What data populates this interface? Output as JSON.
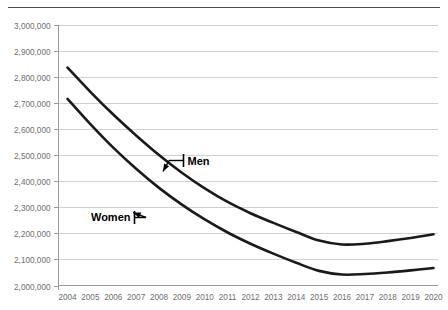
{
  "chart_data": {
    "type": "line",
    "title": "",
    "subtitle": "",
    "xlabel": "",
    "ylabel": "",
    "categories": [
      "2004",
      "2005",
      "2006",
      "2007",
      "2008",
      "2009",
      "2010",
      "2011",
      "2012",
      "2013",
      "2014",
      "2015",
      "2016",
      "2017",
      "2018",
      "2019",
      "2020"
    ],
    "series": [
      {
        "name": "Men",
        "values": [
          2835000,
          2742000,
          2655000,
          2575000,
          2500000,
          2432000,
          2372000,
          2320000,
          2277000,
          2240000,
          2205000,
          2172000,
          2157000,
          2160000,
          2170000,
          2182000,
          2196000
        ]
      },
      {
        "name": "Women",
        "values": [
          2715000,
          2618000,
          2528000,
          2447000,
          2374000,
          2310000,
          2253000,
          2203000,
          2160000,
          2122000,
          2087000,
          2056000,
          2042000,
          2044000,
          2050000,
          2058000,
          2067000
        ]
      }
    ],
    "ylim": [
      2000000,
      3000000
    ],
    "ytick_step": 100000,
    "ytick_labels": [
      "3,000,000",
      "2,900,000",
      "2,800,000",
      "2,700,000",
      "2,600,000",
      "2,500,000",
      "2,400,000",
      "2,300,000",
      "2,200,000",
      "2,100,000",
      "2,000,000"
    ],
    "ytick_values": [
      3000000,
      2900000,
      2800000,
      2700000,
      2600000,
      2500000,
      2400000,
      2300000,
      2200000,
      2100000,
      2000000
    ],
    "grid": true,
    "grid_orientation": "horizontal",
    "legend": "none",
    "annotations": [
      {
        "name": "Men",
        "label": "Men",
        "target_category": "2008",
        "target_value": 2410000
      },
      {
        "name": "Women",
        "label": "Women",
        "target_category": "2007",
        "target_value": 2310000
      }
    ],
    "colors": {
      "men_line": "#1a1a1a",
      "women_line": "#1a1a1a",
      "gridline": "#d0d0d0",
      "axis": "#9a9a9a",
      "tick_label": "#6e6e6e",
      "annotation_text": "#000000",
      "background": "#ffffff",
      "top_rule": "#4a4a4a"
    }
  }
}
